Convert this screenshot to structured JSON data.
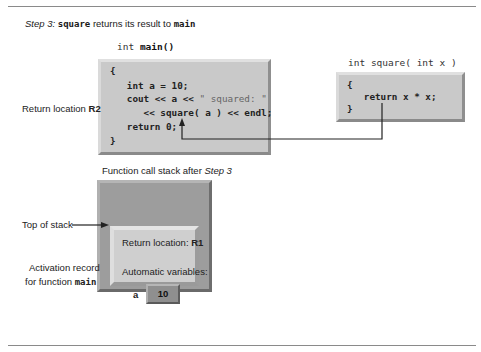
{
  "title": {
    "step_label": "Step 3:",
    "function_name": "square",
    "middle_text": " returns its result to ",
    "target_name": "main"
  },
  "main_function": {
    "header_type": "int ",
    "header_name": "main()",
    "lines": [
      "{",
      "   int a = 10;",
      "   cout << a << ",
      "\" squared: \"",
      "      << square( a ) << endl;",
      "   return 0;",
      "}"
    ]
  },
  "square_function": {
    "header": "int square( int x )",
    "header_name": "square",
    "lines": [
      "{",
      "   return x * x;",
      "}"
    ]
  },
  "return_location_label": {
    "text": "Return location ",
    "code": "R2"
  },
  "stack": {
    "caption_text": "Function call stack after ",
    "caption_step": "Step 3",
    "top_of_stack_label": "Top of stack",
    "activation_record_label_line1": "Activation record",
    "activation_record_label_line2": "for function ",
    "activation_record_function": "main",
    "return_location_text": "Return location: ",
    "return_location_code": "R1",
    "automatic_variables_label": "Automatic variables:",
    "variable_name": "a",
    "variable_value": "10"
  },
  "colors": {
    "code_box_fill": "#c9c9c9",
    "stack_fill": "#9d9d9d",
    "record_fill": "#cfcfcf",
    "variable_fill": "#8f8f8f",
    "arrow": "#222222"
  }
}
